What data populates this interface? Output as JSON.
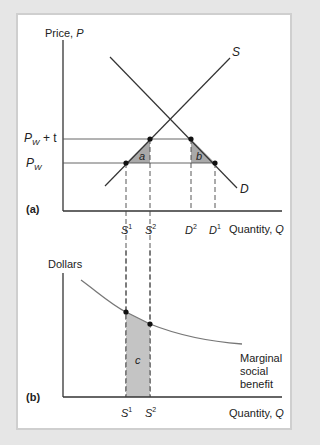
{
  "panel_a": {
    "label": "(a)",
    "y_axis_label": "Price, ",
    "y_axis_var": "P",
    "x_axis_label": "Quantity, ",
    "x_axis_var": "Q",
    "supply_label": "S",
    "demand_label": "D",
    "price_tariff_label": "P",
    "price_tariff_sub": "W",
    "price_tariff_suffix": " + t",
    "price_world_label": "P",
    "price_world_sub": "W",
    "area_a": "a",
    "area_b": "b",
    "ticks": [
      {
        "base": "S",
        "sup": "1"
      },
      {
        "base": "S",
        "sup": "2"
      },
      {
        "base": "D",
        "sup": "2"
      },
      {
        "base": "D",
        "sup": "1"
      }
    ]
  },
  "panel_b": {
    "label": "(b)",
    "y_axis_label": "Dollars",
    "x_axis_label": "Quantity, ",
    "x_axis_var": "Q",
    "curve_label_lines": [
      "Marginal",
      "social",
      "benefit"
    ],
    "area_c": "c",
    "ticks": [
      {
        "base": "S",
        "sup": "1"
      },
      {
        "base": "S",
        "sup": "2"
      }
    ]
  },
  "colors": {
    "line": "#333333",
    "curve": "#777777",
    "shade": "#bdbdbd",
    "background": "#e6e6e6"
  }
}
